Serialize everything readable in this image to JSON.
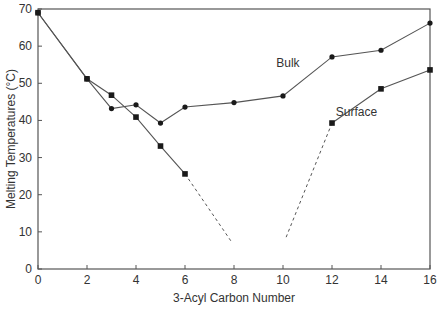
{
  "chart_data": {
    "type": "line",
    "title": "",
    "xlabel": "3-Acyl Carbon Number",
    "ylabel": "Melting Temperatures (°C)",
    "xlim": [
      0,
      16
    ],
    "ylim": [
      0,
      70
    ],
    "xticks": [
      0,
      2,
      4,
      6,
      8,
      10,
      12,
      14,
      16
    ],
    "yticks": [
      0,
      10,
      20,
      30,
      40,
      50,
      60,
      70
    ],
    "grid": false,
    "legend": "inline labels",
    "series": [
      {
        "name": "Bulk",
        "marker": "circle",
        "x": [
          0,
          2,
          3,
          4,
          5,
          6,
          8,
          10,
          12,
          14,
          16
        ],
        "y": [
          69,
          51.2,
          43.2,
          44.2,
          39.3,
          43.6,
          44.8,
          46.6,
          57.1,
          58.9,
          66.2
        ],
        "label_pos": [
          10.2,
          54.5
        ]
      },
      {
        "name": "Surface",
        "marker": "square",
        "x": [
          0,
          2,
          3,
          4,
          5,
          6
        ],
        "y": [
          69,
          51.2,
          46.8,
          40.9,
          33.1,
          25.6
        ],
        "label_pos": [
          13.0,
          41.2
        ]
      },
      {
        "name": "Surface",
        "marker": "square",
        "x": [
          12,
          14,
          16
        ],
        "y": [
          39.3,
          48.5,
          53.6
        ]
      }
    ],
    "extrapolations": [
      {
        "style": "dashed",
        "x": [
          6,
          7.9
        ],
        "y": [
          25.6,
          7.3
        ]
      },
      {
        "style": "dashed",
        "x": [
          12,
          10.1
        ],
        "y": [
          39.3,
          8.1
        ]
      }
    ]
  },
  "colors": {
    "axis": "#555555",
    "line": "#555555",
    "marker": "#1a1a1a",
    "text": "#333333"
  }
}
